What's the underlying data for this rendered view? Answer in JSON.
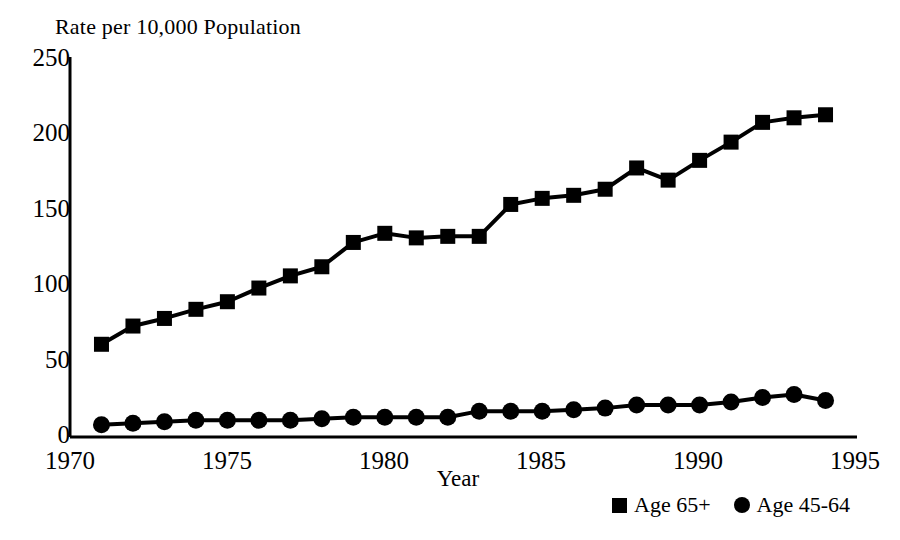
{
  "chart_data": {
    "type": "line",
    "title": "Rate per 10,000 Population",
    "xlabel": "Year",
    "ylabel": "",
    "xlim": [
      1970,
      1995
    ],
    "ylim": [
      0,
      250
    ],
    "xticks": [
      1970,
      1975,
      1980,
      1985,
      1990,
      1995
    ],
    "yticks": [
      0,
      50,
      100,
      150,
      200,
      250
    ],
    "grid": false,
    "legend_position": "bottom-right",
    "x": [
      1971,
      1972,
      1973,
      1974,
      1975,
      1976,
      1977,
      1978,
      1979,
      1980,
      1981,
      1982,
      1983,
      1984,
      1985,
      1986,
      1987,
      1988,
      1989,
      1990,
      1991,
      1992,
      1993,
      1994
    ],
    "series": [
      {
        "name": "Age 65+",
        "marker": "square",
        "values": [
          61,
          73,
          78,
          84,
          89,
          98,
          106,
          112,
          128,
          134,
          131,
          132,
          132,
          153,
          157,
          159,
          163,
          177,
          169,
          182,
          194,
          207,
          210,
          212
        ]
      },
      {
        "name": "Age 45-64",
        "marker": "circle",
        "values": [
          8,
          9,
          10,
          11,
          11,
          11,
          11,
          12,
          13,
          13,
          13,
          13,
          17,
          17,
          17,
          18,
          19,
          21,
          21,
          21,
          23,
          26,
          28,
          24
        ]
      }
    ]
  },
  "title": "Rate per 10,000 Population",
  "axes": {
    "x_title": "Year",
    "x_tick_labels": [
      "1970",
      "1975",
      "1980",
      "1985",
      "1990",
      "1995"
    ],
    "y_tick_labels": [
      "250",
      "200",
      "150",
      "100",
      "50",
      "0"
    ]
  },
  "legend": {
    "items": [
      {
        "label": "Age 65+",
        "marker": "square"
      },
      {
        "label": "Age 45-64",
        "marker": "circle"
      }
    ]
  }
}
